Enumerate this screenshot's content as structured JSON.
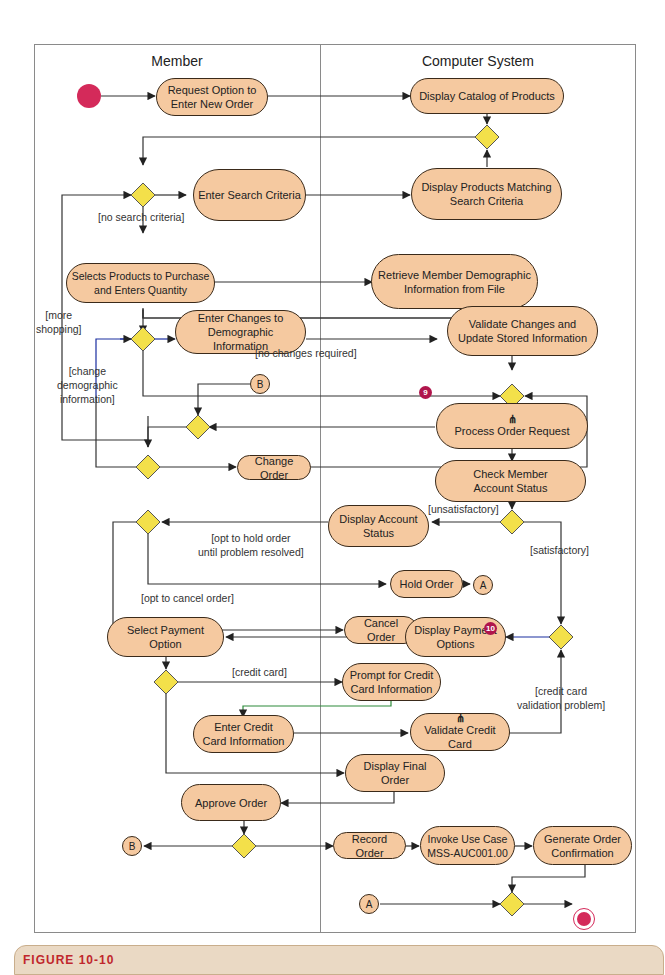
{
  "lanes": {
    "left": "Member",
    "right": "Computer System"
  },
  "nodes": {
    "request_option": "Request Option to\nEnter New Order",
    "display_catalog": "Display Catalog of Products",
    "enter_search": "Enter Search Criteria",
    "display_matching": "Display Products Matching\nSearch Criteria",
    "selects_products": "Selects Products to Purchase\nand Enters Quantity",
    "retrieve_member": "Retrieve Member Demographic\nInformation from File",
    "enter_changes": "Enter Changes to\nDemographic Information",
    "validate_changes": "Validate Changes and\nUpdate Stored Information",
    "process_order": "Process Order Request",
    "change_order": "Change Order",
    "check_member": "Check Member\nAccount Status",
    "display_account": "Display Account\nStatus",
    "hold_order": "Hold Order",
    "cancel_order": "Cancel Order",
    "select_payment": "Select Payment Option",
    "display_payment": "Display Payment\nOptions",
    "prompt_credit": "Prompt for Credit\nCard Information",
    "enter_credit": "Enter Credit\nCard Information",
    "validate_credit": "Validate Credit Card",
    "display_final": "Display Final\nOrder",
    "approve_order": "Approve Order",
    "record_order": "Record Order",
    "invoke_use_case": "Invoke Use Case\nMSS-AUC001.00",
    "generate_confirmation": "Generate Order\nConfirmation"
  },
  "fork_symbol": "⋔",
  "connectors": {
    "b": "B",
    "a": "A"
  },
  "guards": {
    "no_search": "[no search criteria]",
    "more_shopping": "[more\nshopping]",
    "change_demo": "[change\ndemographic\ninformation]",
    "no_changes": "[no changes required]",
    "unsatisfactory": "[unsatisfactory]",
    "satisfactory": "[satisfactory]",
    "opt_hold": "[opt to hold order\nuntil problem resolved]",
    "opt_cancel": "[opt to cancel order]",
    "credit_card": "[credit card]",
    "cc_problem": "[credit card\nvalidation problem]"
  },
  "badges": {
    "nine": "9",
    "ten": "10"
  },
  "caption": "FIGURE 10-10",
  "colors": {
    "node_fill": "#f5c9a0",
    "decision_fill": "#f3e04a",
    "start_end": "#d42a5a",
    "badge": "#b0154c"
  }
}
